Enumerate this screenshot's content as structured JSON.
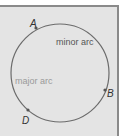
{
  "figure": {
    "circle": {
      "cx": 60,
      "cy": 73,
      "r": 49,
      "stroke": "#6b6b6b"
    },
    "points": [
      {
        "name": "A",
        "x": 36,
        "y": 28,
        "label_x": 30,
        "label_y": 26
      },
      {
        "name": "B",
        "x": 105,
        "y": 90,
        "label_x": 108,
        "label_y": 96
      },
      {
        "name": "D",
        "x": 28,
        "y": 110,
        "label_x": 21,
        "label_y": 124
      }
    ],
    "labels": {
      "minor_arc": "minor arc",
      "major_arc": "major arc"
    },
    "colors": {
      "background": "#e4e4e4",
      "border": "#8a8a8a",
      "curve": "#6b6b6b",
      "minor_text": "#555555",
      "major_text": "#9a9a9a"
    }
  }
}
